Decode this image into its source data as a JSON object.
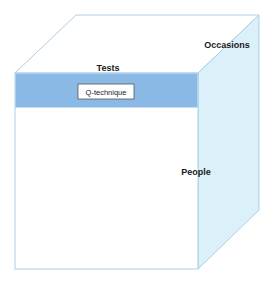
{
  "diagram": {
    "type": "data-cube",
    "axes": {
      "top_front_edge_label": "Tests",
      "depth_label": "Occasions",
      "side_label": "People"
    },
    "slice": {
      "label": "Q-technique",
      "description": "horizontal slice across tests (highlighted row)"
    },
    "colors": {
      "slice_fill": "#8ab9e6",
      "side_face_fill": "#dcefF9",
      "edge_stroke": "#a9d0e8",
      "front_face_fill": "#ffffff",
      "top_face_fill": "#ffffff"
    }
  }
}
